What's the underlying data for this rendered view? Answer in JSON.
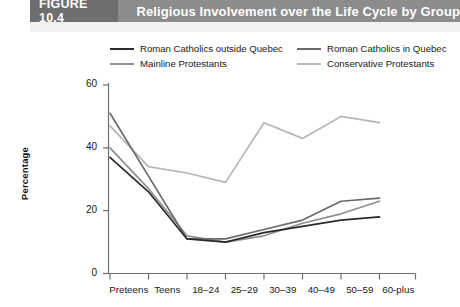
{
  "figure": {
    "number_label": "FIGURE 10.4",
    "title": "Religious Involvement over the Life Cycle by Group",
    "header_bg": "#8c8c8c",
    "number_bg": "#6e6e6e",
    "header_text_color": "#ffffff"
  },
  "chart_data": {
    "type": "line",
    "title": "Religious Involvement over the Life Cycle by Group",
    "xlabel": "",
    "ylabel": "Percentage",
    "categories": [
      "Preteens",
      "Teens",
      "18–24",
      "25–29",
      "30–39",
      "40–49",
      "50–59",
      "60-plus"
    ],
    "yticks": [
      0,
      20,
      40,
      60
    ],
    "ylim": [
      0,
      60
    ],
    "grid": false,
    "legend_position": "top",
    "series": [
      {
        "name": "Roman Catholics outside Quebec",
        "color": "#2b2b2b",
        "values": [
          37,
          26,
          11,
          10,
          13,
          15,
          17,
          18
        ]
      },
      {
        "name": "Roman Catholics in Quebec",
        "color": "#6b6b6b",
        "values": [
          51,
          31,
          11,
          11,
          14,
          17,
          23,
          24
        ]
      },
      {
        "name": "Mainline Protestants",
        "color": "#8f8f8f",
        "values": [
          40,
          27,
          12,
          10,
          12,
          16,
          19,
          23
        ]
      },
      {
        "name": "Conservative Protestants",
        "color": "#b6b6b6",
        "values": [
          47,
          34,
          32,
          29,
          48,
          43,
          50,
          48
        ]
      }
    ]
  },
  "axis": {
    "y_tick_labels": [
      "0",
      "20",
      "40",
      "60"
    ],
    "y_axis_title": "Percentage"
  }
}
